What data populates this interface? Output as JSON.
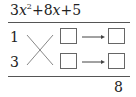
{
  "expression": {
    "coef_a": "3",
    "var": "x",
    "exp": "2",
    "op1": "+",
    "coef_b": "8",
    "var2": "x",
    "op2": "+",
    "const": "5"
  },
  "factors": {
    "top_left": "1",
    "bottom_left": "3"
  },
  "boxes": {
    "row1_left": "",
    "row1_right": "",
    "row2_left": "",
    "row2_right": ""
  },
  "sum": "8",
  "icons": {
    "cross": "cross-multiply-icon",
    "arrow": "right-arrow-icon"
  }
}
